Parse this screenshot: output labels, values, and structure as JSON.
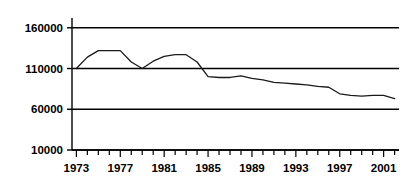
{
  "chart_data": {
    "type": "line",
    "title": "",
    "xlabel": "",
    "ylabel": "",
    "xlim": [
      1972.6,
      2002.4
    ],
    "ylim": [
      10000,
      172000
    ],
    "grid": true,
    "legend": null,
    "yticks": [
      10000,
      60000,
      110000,
      160000
    ],
    "ytick_labels": [
      "10000",
      "60000",
      "110000",
      "160000"
    ],
    "xticks": [
      1973,
      1974,
      1975,
      1976,
      1977,
      1978,
      1979,
      1980,
      1981,
      1982,
      1983,
      1984,
      1985,
      1986,
      1987,
      1988,
      1989,
      1990,
      1991,
      1992,
      1993,
      1994,
      1995,
      1996,
      1997,
      1998,
      1999,
      2000,
      2001,
      2002
    ],
    "xtick_labels": [
      "1973",
      "1977",
      "1981",
      "1985",
      "1989",
      "1993",
      "1997",
      "2001"
    ],
    "xtick_labeled_values": [
      1973,
      1977,
      1981,
      1985,
      1989,
      1993,
      1997,
      2001
    ],
    "series": [
      {
        "name": "series-1",
        "color": "#1a1a1a",
        "x": [
          1973,
          1974,
          1975,
          1976,
          1977,
          1978,
          1979,
          1980,
          1981,
          1982,
          1983,
          1984,
          1985,
          1986,
          1987,
          1988,
          1989,
          1990,
          1991,
          1992,
          1993,
          1994,
          1995,
          1996,
          1997,
          1998,
          1999,
          2000,
          2001,
          2002
        ],
        "values": [
          110000,
          124000,
          132000,
          132000,
          132000,
          118000,
          110000,
          119000,
          125000,
          127000,
          127000,
          118000,
          100000,
          99000,
          99000,
          101000,
          98000,
          96000,
          93000,
          92000,
          91000,
          90000,
          88000,
          87000,
          79000,
          77000,
          76000,
          77000,
          77000,
          73000
        ]
      }
    ]
  }
}
